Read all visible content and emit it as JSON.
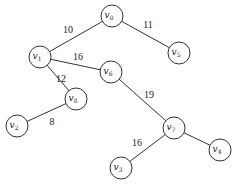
{
  "diagram": {
    "type": "weighted-tree",
    "nodes": [
      {
        "id": "v0",
        "base": "v",
        "sub": "0",
        "x": 112,
        "y": 16
      },
      {
        "id": "v1",
        "base": "v",
        "sub": "1",
        "x": 40,
        "y": 57
      },
      {
        "id": "v5",
        "base": "v",
        "sub": "5",
        "x": 179,
        "y": 53
      },
      {
        "id": "v6",
        "base": "v",
        "sub": "6",
        "x": 111,
        "y": 72
      },
      {
        "id": "v8",
        "base": "v",
        "sub": "8",
        "x": 76,
        "y": 99
      },
      {
        "id": "v2",
        "base": "v",
        "sub": "2",
        "x": 17,
        "y": 126
      },
      {
        "id": "v7",
        "base": "v",
        "sub": "7",
        "x": 174,
        "y": 128
      },
      {
        "id": "v4",
        "base": "v",
        "sub": "4",
        "x": 220,
        "y": 150
      },
      {
        "id": "v3",
        "base": "v",
        "sub": "3",
        "x": 121,
        "y": 168
      }
    ],
    "edges": [
      {
        "from": "v0",
        "to": "v1",
        "weight": "10",
        "lx": 68,
        "ly": 33
      },
      {
        "from": "v0",
        "to": "v5",
        "weight": "11",
        "lx": 148,
        "ly": 28
      },
      {
        "from": "v1",
        "to": "v6",
        "weight": "16",
        "lx": 78,
        "ly": 60
      },
      {
        "from": "v1",
        "to": "v8",
        "weight": "12",
        "lx": 61,
        "ly": 82
      },
      {
        "from": "v8",
        "to": "v2",
        "weight": "8",
        "lx": 52,
        "ly": 125
      },
      {
        "from": "v6",
        "to": "v7",
        "weight": "19",
        "lx": 149,
        "ly": 98
      },
      {
        "from": "v7",
        "to": "v3",
        "weight": "16",
        "lx": 137,
        "ly": 146
      },
      {
        "from": "v7",
        "to": "v4",
        "weight": "",
        "lx": 0,
        "ly": 0
      }
    ]
  },
  "node_radius": 11,
  "colors": {
    "stroke": "#333333",
    "text": "#222222",
    "background": "#ffffff"
  }
}
